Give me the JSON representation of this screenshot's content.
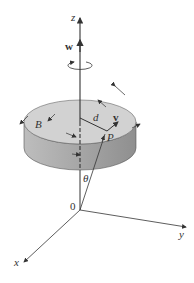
{
  "diagram": {
    "type": "rotating-disc-3d-axes",
    "labels": {
      "z_axis": "z",
      "y_axis": "y",
      "x_axis": "x",
      "origin": "0",
      "angular_velocity": "w",
      "point": "P",
      "body": "B",
      "distance": "d",
      "velocity": "v",
      "angle": "θ"
    },
    "colors": {
      "disc_top": "#cfcfcf",
      "disc_side": "#a9a9a9",
      "lines": "#333333"
    }
  }
}
